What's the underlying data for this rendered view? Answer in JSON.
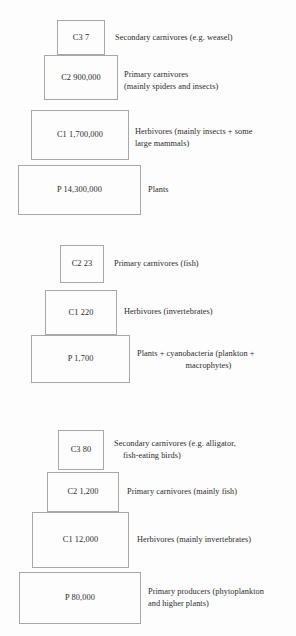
{
  "figure": {
    "kind": "ecological-pyramids-of-numbers",
    "background_color": "#fdfdfd",
    "box_border_color": "#a8a8a8",
    "text_color": "#2b2b2b"
  },
  "pyramids": [
    {
      "id": "pyramid-1",
      "tiers": [
        {
          "box_label": "C3 7",
          "trophic_code": "C3",
          "value": "7",
          "description_line1": "Secondary carnivores (e.g. weasel)",
          "description_line2": ""
        },
        {
          "box_label": "C2 900,000",
          "trophic_code": "C2",
          "value": "900,000",
          "description_line1": "Primary carnivores",
          "description_line2": "(mainly spiders and insects)"
        },
        {
          "box_label": "C1 1,700,000",
          "trophic_code": "C1",
          "value": "1,700,000",
          "description_line1": "Herbivores (mainly insects + some",
          "description_line2": "large mammals)"
        },
        {
          "box_label": "P 14,300,000",
          "trophic_code": "P",
          "value": "14,300,000",
          "description_line1": "Plants",
          "description_line2": ""
        }
      ]
    },
    {
      "id": "pyramid-2",
      "tiers": [
        {
          "box_label": "C2 23",
          "trophic_code": "C2",
          "value": "23",
          "description_line1": "Primary carnivores (fish)",
          "description_line2": ""
        },
        {
          "box_label": "C1 220",
          "trophic_code": "C1",
          "value": "220",
          "description_line1": "Herbivores (invertebrates)",
          "description_line2": ""
        },
        {
          "box_label": "P 1,700",
          "trophic_code": "P",
          "value": "1,700",
          "description_line1": "Plants + cyanobacteria (plankton +",
          "description_line2": "macrophytes)"
        }
      ]
    },
    {
      "id": "pyramid-3",
      "tiers": [
        {
          "box_label": "C3 80",
          "trophic_code": "C3",
          "value": "80",
          "description_line1": "Secondary carnivores (e.g. alligator,",
          "description_line2": "fish-eating birds)"
        },
        {
          "box_label": "C2 1,200",
          "trophic_code": "C2",
          "value": "1,200",
          "description_line1": "Primary carnivores (mainly fish)",
          "description_line2": ""
        },
        {
          "box_label": "C1 12,000",
          "trophic_code": "C1",
          "value": "12,000",
          "description_line1": "Herbivores (mainly invertebrates)",
          "description_line2": ""
        },
        {
          "box_label": "P 80,000",
          "trophic_code": "P",
          "value": "80,000",
          "description_line1": "Primary producers (phytoplankton",
          "description_line2": "and higher plants)"
        }
      ]
    }
  ]
}
